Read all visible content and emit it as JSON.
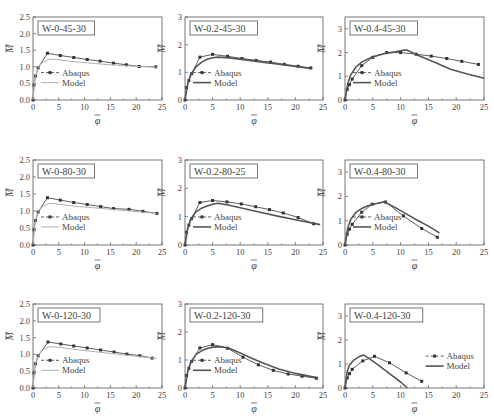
{
  "figure": {
    "layout": {
      "rows": 3,
      "cols": 3
    },
    "legend_labels": {
      "abaqus": "Abaqus",
      "model": "Model"
    },
    "axis_labels": {
      "x": "φ",
      "y": "M"
    },
    "colors": {
      "abaqus": "#333333",
      "model_col1": "#b0b0b0",
      "model_other": "#555555",
      "frame": "#555555"
    }
  },
  "chart_data": [
    {
      "type": "line",
      "title": "W-0-45-30",
      "xlabel": "φ̄",
      "ylabel": "M̄",
      "xlim": [
        0,
        25
      ],
      "ylim": [
        0,
        2.5
      ],
      "xticks": [
        0,
        5,
        10,
        15,
        20,
        25
      ],
      "yticks": [
        0.0,
        0.5,
        1.0,
        1.5,
        2.0,
        2.5
      ],
      "ytick_labels": [
        "0.0",
        "0.5",
        "1.0",
        "1.5",
        "2.0",
        "2.5"
      ],
      "legend_position": "lower-left",
      "series": [
        {
          "name": "Abaqus",
          "style": "dashed-marker",
          "x": [
            0,
            0.2,
            0.5,
            1.0,
            2.8,
            5.3,
            7.9,
            10.5,
            13.0,
            15.6,
            18.1,
            20.6,
            23.8
          ],
          "y": [
            0,
            0.45,
            0.72,
            0.97,
            1.41,
            1.34,
            1.28,
            1.22,
            1.17,
            1.11,
            1.06,
            1.01,
            1.0
          ]
        },
        {
          "name": "Model",
          "style": "solid-light",
          "x": [
            0,
            0.3,
            0.7,
            1.2,
            2.0,
            3.0,
            4.0,
            6.0,
            9.0,
            12.0,
            15.0,
            18.0,
            21.0,
            24.0
          ],
          "y": [
            0,
            0.55,
            0.85,
            1.02,
            1.15,
            1.22,
            1.23,
            1.19,
            1.14,
            1.1,
            1.06,
            1.03,
            1.01,
            0.99
          ]
        }
      ]
    },
    {
      "type": "line",
      "title": "W-0.2-45-30",
      "xlabel": "φ̄",
      "ylabel": "M̄",
      "xlim": [
        0,
        25
      ],
      "ylim": [
        0,
        3
      ],
      "xticks": [
        0,
        5,
        10,
        15,
        20,
        25
      ],
      "yticks": [
        0,
        1,
        2,
        3
      ],
      "ytick_labels": [
        "0",
        "1",
        "2",
        "3"
      ],
      "legend_position": "lower-left",
      "series": [
        {
          "name": "Abaqus",
          "style": "dashed-marker",
          "x": [
            0,
            0.3,
            0.7,
            1.2,
            2.7,
            5.0,
            7.7,
            10.3,
            12.9,
            15.5,
            18.0,
            20.5,
            22.8
          ],
          "y": [
            0,
            0.45,
            0.7,
            0.95,
            1.55,
            1.65,
            1.58,
            1.5,
            1.43,
            1.37,
            1.29,
            1.22,
            1.16
          ]
        },
        {
          "name": "Model",
          "style": "solid",
          "x": [
            0,
            0.5,
            1.0,
            2.0,
            3.0,
            4.0,
            5.0,
            6.0,
            8.0,
            11.0,
            14.0,
            17.0,
            20.0,
            23.0
          ],
          "y": [
            0,
            0.6,
            0.9,
            1.2,
            1.37,
            1.47,
            1.53,
            1.55,
            1.52,
            1.45,
            1.37,
            1.29,
            1.21,
            1.13
          ]
        }
      ]
    },
    {
      "type": "line",
      "title": "W-0.4-45-30",
      "xlabel": "φ̄",
      "ylabel": "M̄",
      "xlim": [
        0,
        25
      ],
      "ylim": [
        0,
        3.5
      ],
      "xticks": [
        0,
        5,
        10,
        15,
        20,
        25
      ],
      "yticks": [
        0,
        1,
        2,
        3
      ],
      "ytick_labels": [
        "0",
        "1",
        "2",
        "3"
      ],
      "legend_position": "lower-left",
      "series": [
        {
          "name": "Abaqus",
          "style": "dashed-marker",
          "x": [
            0,
            0.4,
            0.8,
            1.3,
            3.0,
            5.0,
            7.5,
            10.0,
            12.8,
            15.5,
            18.3,
            21.0,
            24.0
          ],
          "y": [
            0,
            0.45,
            0.65,
            0.88,
            1.45,
            1.8,
            2.0,
            2.0,
            1.93,
            1.85,
            1.75,
            1.63,
            1.5
          ]
        },
        {
          "name": "Model",
          "style": "solid",
          "x": [
            0,
            0.5,
            1.0,
            2.0,
            3.0,
            5.0,
            7.0,
            9.0,
            11.0,
            13.0,
            16.0,
            19.0,
            22.0,
            25.0
          ],
          "y": [
            0,
            0.7,
            1.05,
            1.4,
            1.6,
            1.82,
            1.95,
            2.03,
            2.12,
            1.9,
            1.6,
            1.3,
            1.1,
            0.92
          ]
        }
      ]
    },
    {
      "type": "line",
      "title": "W-0-80-30",
      "xlabel": "φ̄",
      "ylabel": "M̄",
      "xlim": [
        0,
        25
      ],
      "ylim": [
        0,
        2.5
      ],
      "xticks": [
        0,
        5,
        10,
        15,
        20,
        25
      ],
      "yticks": [
        0.0,
        0.5,
        1.0,
        1.5,
        2.0,
        2.5
      ],
      "ytick_labels": [
        "0.0",
        "0.5",
        "1.0",
        "1.5",
        "2.0",
        "2.5"
      ],
      "legend_position": "lower-left",
      "series": [
        {
          "name": "Abaqus",
          "style": "dashed-marker",
          "x": [
            0,
            0.2,
            0.5,
            1.0,
            2.8,
            5.3,
            7.9,
            10.5,
            13.1,
            15.6,
            18.6,
            21.3,
            24.0
          ],
          "y": [
            0,
            0.45,
            0.72,
            0.97,
            1.39,
            1.32,
            1.25,
            1.19,
            1.13,
            1.07,
            1.05,
            0.99,
            0.93
          ]
        },
        {
          "name": "Model",
          "style": "solid-light",
          "x": [
            0,
            0.3,
            0.7,
            1.2,
            2.0,
            3.0,
            4.0,
            6.0,
            9.0,
            12.0,
            15.0,
            18.0,
            21.0,
            24.0
          ],
          "y": [
            0,
            0.55,
            0.85,
            1.02,
            1.15,
            1.22,
            1.22,
            1.18,
            1.13,
            1.09,
            1.05,
            1.01,
            0.97,
            0.93
          ]
        }
      ]
    },
    {
      "type": "line",
      "title": "W-0.2-80-25",
      "xlabel": "φ̄",
      "ylabel": "M̄",
      "xlim": [
        0,
        25
      ],
      "ylim": [
        0,
        3
      ],
      "xticks": [
        0,
        5,
        10,
        15,
        20,
        25
      ],
      "yticks": [
        0,
        1,
        2,
        3
      ],
      "ytick_labels": [
        "0",
        "1",
        "2",
        "3"
      ],
      "legend_position": "lower-left",
      "series": [
        {
          "name": "Abaqus",
          "style": "dashed-marker",
          "x": [
            0,
            0.3,
            0.7,
            1.2,
            2.7,
            5.0,
            7.6,
            10.2,
            12.8,
            15.3,
            17.8,
            20.5,
            23.3
          ],
          "y": [
            0,
            0.45,
            0.7,
            0.93,
            1.5,
            1.57,
            1.52,
            1.45,
            1.35,
            1.25,
            1.13,
            0.97,
            0.75
          ]
        },
        {
          "name": "Model",
          "style": "solid",
          "x": [
            0,
            0.5,
            1.0,
            2.0,
            3.0,
            4.0,
            5.0,
            6.0,
            8.0,
            11.0,
            14.0,
            17.0,
            20.0,
            24.5
          ],
          "y": [
            0,
            0.6,
            0.9,
            1.17,
            1.3,
            1.38,
            1.44,
            1.47,
            1.4,
            1.27,
            1.14,
            1.01,
            0.89,
            0.72
          ]
        }
      ]
    },
    {
      "type": "line",
      "title": "W-0.4-80-30",
      "xlabel": "φ̄",
      "ylabel": "M̄",
      "xlim": [
        0,
        25
      ],
      "ylim": [
        0,
        3.5
      ],
      "xticks": [
        0,
        5,
        10,
        15,
        20,
        25
      ],
      "yticks": [
        0,
        1,
        2,
        3
      ],
      "ytick_labels": [
        "0",
        "1",
        "2",
        "3"
      ],
      "legend_position": "lower-left",
      "series": [
        {
          "name": "Abaqus",
          "style": "dashed-marker",
          "x": [
            0,
            0.4,
            0.8,
            1.3,
            3.0,
            4.9,
            7.3,
            10.5,
            13.8,
            16.6
          ],
          "y": [
            0,
            0.45,
            0.65,
            0.85,
            1.35,
            1.68,
            1.77,
            1.2,
            0.68,
            0.32
          ]
        },
        {
          "name": "Model",
          "style": "solid",
          "x": [
            0,
            0.5,
            1.0,
            2.0,
            3.0,
            4.0,
            5.5,
            7.0,
            9.0,
            11.0,
            13.0,
            15.0,
            17.0
          ],
          "y": [
            0,
            0.7,
            1.05,
            1.35,
            1.5,
            1.6,
            1.7,
            1.78,
            1.55,
            1.28,
            1.02,
            0.78,
            0.5
          ]
        }
      ]
    },
    {
      "type": "line",
      "title": "W-0-120-30",
      "xlabel": "φ̄",
      "ylabel": "M̄",
      "xlim": [
        0,
        25
      ],
      "ylim": [
        0,
        2.5
      ],
      "xticks": [
        0,
        5,
        10,
        15,
        20,
        25
      ],
      "yticks": [
        0.0,
        0.5,
        1.0,
        1.5,
        2.0,
        2.5
      ],
      "ytick_labels": [
        "0.0",
        "0.5",
        "1.0",
        "1.5",
        "2.0",
        "2.5"
      ],
      "legend_position": "lower-left",
      "series": [
        {
          "name": "Abaqus",
          "style": "dashed-marker",
          "x": [
            0,
            0.2,
            0.5,
            1.0,
            2.9,
            5.4,
            7.9,
            10.5,
            13.1,
            15.7,
            18.2,
            20.7,
            23.1
          ],
          "y": [
            0,
            0.45,
            0.72,
            0.96,
            1.37,
            1.31,
            1.25,
            1.19,
            1.13,
            1.07,
            1.01,
            0.96,
            0.89
          ]
        },
        {
          "name": "Model",
          "style": "solid-light",
          "x": [
            0,
            0.3,
            0.7,
            1.2,
            2.0,
            3.0,
            4.0,
            6.0,
            9.0,
            12.0,
            15.0,
            18.0,
            21.0,
            24.0
          ],
          "y": [
            0,
            0.55,
            0.85,
            1.02,
            1.15,
            1.22,
            1.23,
            1.19,
            1.13,
            1.08,
            1.03,
            0.98,
            0.93,
            0.88
          ]
        }
      ]
    },
    {
      "type": "line",
      "title": "W-0.2-120-30",
      "xlabel": "φ̄",
      "ylabel": "M̄",
      "xlim": [
        0,
        25
      ],
      "ylim": [
        0,
        3
      ],
      "xticks": [
        0,
        5,
        10,
        15,
        20,
        25
      ],
      "yticks": [
        0,
        1,
        2,
        3
      ],
      "ytick_labels": [
        "0",
        "1",
        "2",
        "3"
      ],
      "legend_position": "lower-left",
      "series": [
        {
          "name": "Abaqus",
          "style": "dashed-marker",
          "x": [
            0,
            0.3,
            0.7,
            1.2,
            2.7,
            5.0,
            7.7,
            10.5,
            13.3,
            16.0,
            18.7,
            21.2,
            23.8
          ],
          "y": [
            0,
            0.45,
            0.7,
            0.95,
            1.43,
            1.55,
            1.42,
            1.1,
            0.83,
            0.63,
            0.5,
            0.42,
            0.35
          ]
        },
        {
          "name": "Model",
          "style": "solid",
          "x": [
            0,
            0.5,
            1.0,
            2.0,
            3.0,
            4.0,
            5.0,
            6.5,
            8.0,
            10.0,
            12.0,
            14.0,
            17.0,
            20.0,
            23.8
          ],
          "y": [
            0,
            0.6,
            0.9,
            1.2,
            1.33,
            1.41,
            1.46,
            1.48,
            1.42,
            1.25,
            1.07,
            0.9,
            0.68,
            0.52,
            0.37
          ]
        }
      ]
    },
    {
      "type": "line",
      "title": "W-0.4-120-30",
      "xlabel": "φ̄",
      "ylabel": "M̄",
      "xlim": [
        0,
        25
      ],
      "ylim": [
        0,
        3.5
      ],
      "xticks": [
        0,
        5,
        10,
        15,
        20,
        25
      ],
      "yticks": [
        0,
        1,
        2,
        3
      ],
      "ytick_labels": [
        "0",
        "1",
        "2",
        "3"
      ],
      "legend_position": "right",
      "series": [
        {
          "name": "Abaqus",
          "style": "dashed-marker",
          "x": [
            0,
            0.4,
            0.8,
            1.3,
            3.2,
            5.3,
            8.0,
            11.0,
            13.8
          ],
          "y": [
            0,
            0.42,
            0.6,
            0.78,
            1.13,
            1.32,
            1.05,
            0.63,
            0.28
          ]
        },
        {
          "name": "Model",
          "style": "solid",
          "x": [
            0,
            0.4,
            0.8,
            1.5,
            2.5,
            3.3,
            4.5,
            6.0,
            8.0,
            10.0,
            11.2
          ],
          "y": [
            0,
            0.7,
            0.95,
            1.15,
            1.3,
            1.38,
            1.2,
            0.95,
            0.6,
            0.25,
            0.0
          ]
        }
      ]
    }
  ]
}
